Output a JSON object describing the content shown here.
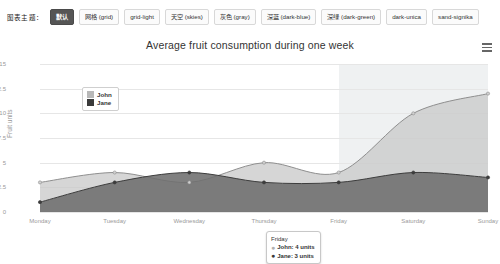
{
  "toolbar": {
    "label": "图表主题：",
    "buttons": [
      {
        "label": "默认",
        "active": true
      },
      {
        "label": "网格 (grid)",
        "active": false
      },
      {
        "label": "grid-light",
        "active": false
      },
      {
        "label": "天空 (skies)",
        "active": false
      },
      {
        "label": "灰色 (gray)",
        "active": false
      },
      {
        "label": "深蓝 (dark-blue)",
        "active": false
      },
      {
        "label": "深绿 (dark-green)",
        "active": false
      },
      {
        "label": "dark-unica",
        "active": false
      },
      {
        "label": "sand-signika",
        "active": false
      }
    ]
  },
  "chart": {
    "context_menu_icon": "hamburger-menu-icon",
    "legend": {
      "items": [
        {
          "name": "John",
          "color": "#b8b8b8"
        },
        {
          "name": "Jane",
          "color": "#3a3a3a"
        }
      ]
    },
    "tooltip": {
      "header": "Friday",
      "rows": [
        {
          "bullet": "●",
          "text": "John: 4 units",
          "color": "#b0b0b0"
        },
        {
          "bullet": "●",
          "text": "Jane: 3 units",
          "color": "#3a3a3a"
        }
      ]
    }
  },
  "chart_data": {
    "type": "area",
    "title": "Average fruit consumption during one week",
    "subtitle": "",
    "xlabel": "",
    "ylabel": "Fruit units",
    "categories": [
      "Monday",
      "Tuesday",
      "Wednesday",
      "Thursday",
      "Friday",
      "Saturday",
      "Sunday"
    ],
    "xtick_labels": [
      "Monday",
      "Tuesday",
      "Wednesday",
      "Thursday",
      "Friday",
      "Saturday",
      "Sunday"
    ],
    "ytick_labels": [
      "0",
      "2.5",
      "5",
      "7.5",
      "10",
      "12.5",
      "15"
    ],
    "ytick_values": [
      0,
      2.5,
      5,
      7.5,
      10,
      12.5,
      15
    ],
    "ylim": [
      0,
      15
    ],
    "grid": true,
    "legend_position": "top-left-inside",
    "stacked": false,
    "series": [
      {
        "name": "John",
        "color": "#b8b8b8",
        "values": [
          3,
          4,
          3,
          5,
          4,
          10,
          12
        ]
      },
      {
        "name": "Jane",
        "color": "#4d4d4d",
        "values": [
          1,
          3,
          4,
          3,
          3,
          4,
          3.5
        ]
      }
    ],
    "plot_band": {
      "label": "weekend",
      "from_category": "Friday",
      "to_category": "Sunday",
      "color": "#eff1f2"
    }
  }
}
